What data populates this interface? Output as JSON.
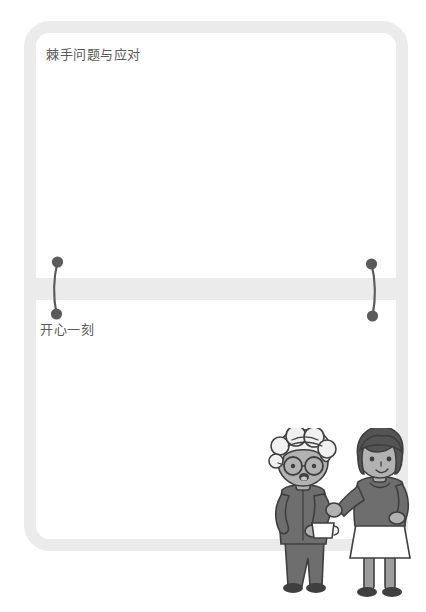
{
  "page": {
    "background_color": "#ffffff",
    "frame_color": "#ebebeb",
    "card_face_color": "#ffffff",
    "text_color": "#5a5a5a",
    "connector_color": "#5b5b5b"
  },
  "cards": {
    "top": {
      "title": "棘手问题与应对"
    },
    "bottom": {
      "title": "开心一刻"
    }
  },
  "connectors": [
    {
      "name": "left-connector",
      "top_dot": "●",
      "bottom_dot": "●"
    },
    {
      "name": "right-connector",
      "top_dot": "●",
      "bottom_dot": "●"
    }
  ],
  "illustration": {
    "name": "two-women-conversation-illustration",
    "figures": [
      {
        "name": "elderly-woman",
        "hair": "white-curly",
        "accessory": "round-glasses",
        "holding": "white-cup",
        "outfit": "dark-gray-jacket-and-trousers"
      },
      {
        "name": "young-woman",
        "hair": "dark-bob",
        "outfit": "dark-gray-top-and-white-skirt",
        "gesture": "raised-hand"
      }
    ],
    "palette": {
      "skin": "#b9b9b9",
      "dark_clothing": "#6e6e6e",
      "light_hair": "#f1f1f1",
      "dark_hair": "#555555",
      "outline": "#3f3f3f",
      "white": "#ffffff"
    }
  }
}
